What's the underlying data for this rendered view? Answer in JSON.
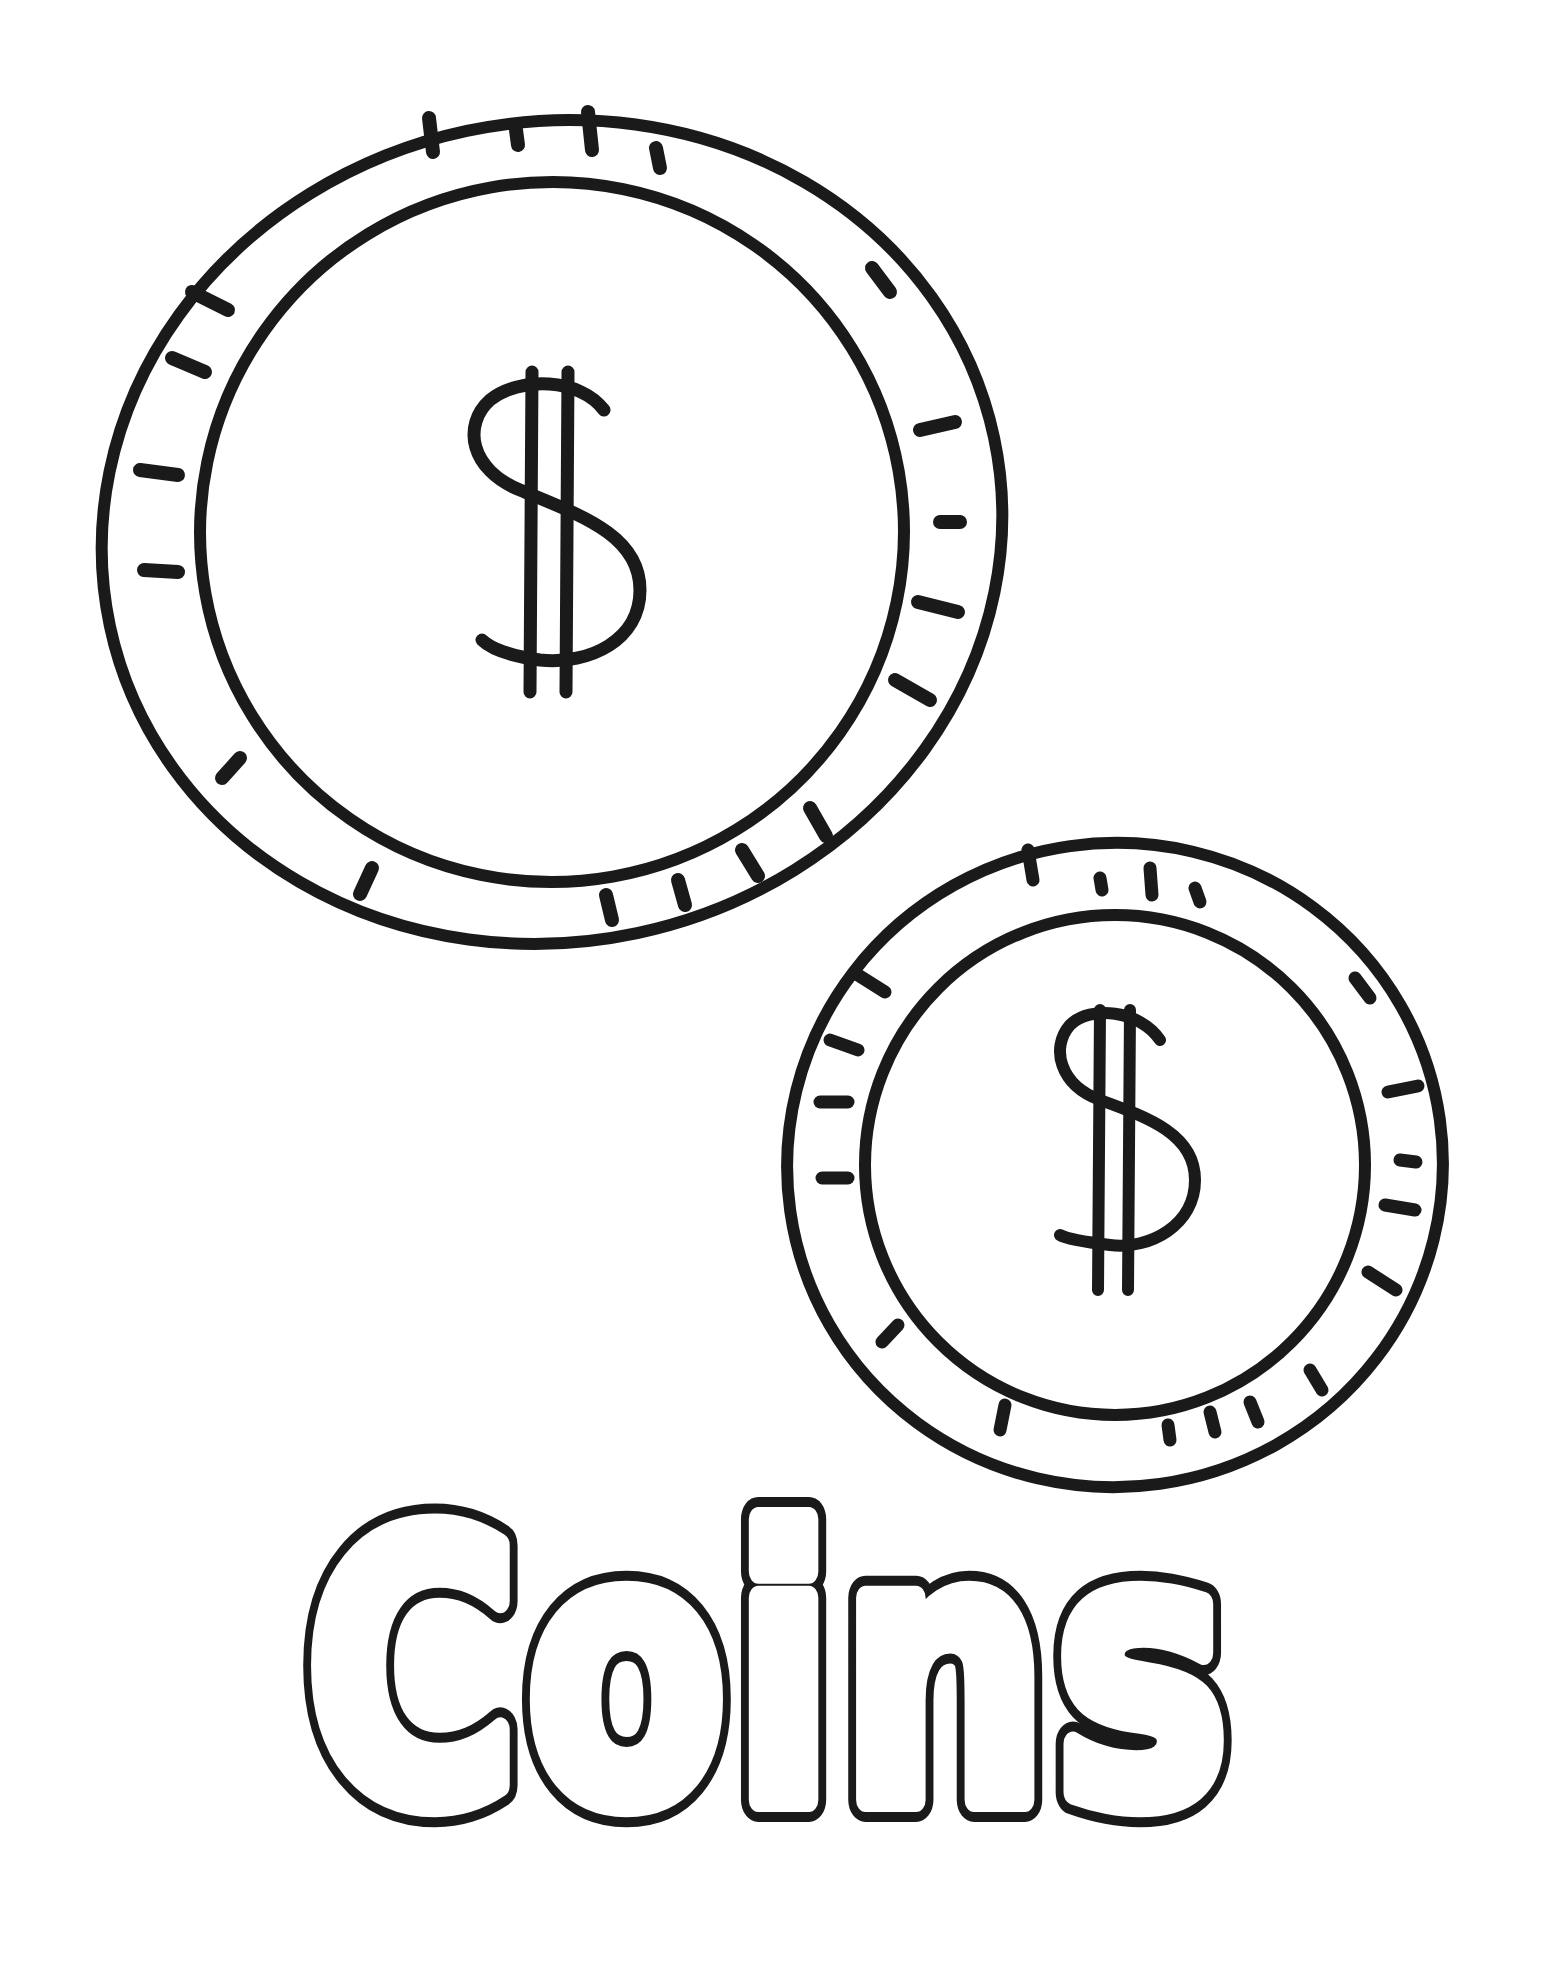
{
  "page": {
    "background": "#ffffff",
    "line_color": "#1a1a1a"
  },
  "coins": [
    {
      "name": "large-coin",
      "symbol": "$",
      "cx": 552,
      "cy": 530,
      "outer_r": 452,
      "inner_r": 352
    },
    {
      "name": "small-coin",
      "symbol": "$",
      "cx": 1115,
      "cy": 1165,
      "outer_r": 332,
      "inner_r": 253
    }
  ],
  "title": {
    "text": "Coins"
  }
}
